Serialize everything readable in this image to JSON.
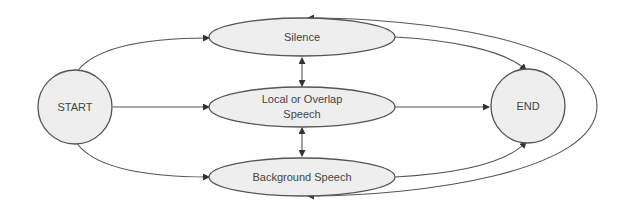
{
  "diagram": {
    "type": "state-transition",
    "colors": {
      "node_fill": "#eeeeee",
      "stroke": "#555555",
      "text": "#444444"
    },
    "nodes": {
      "start": {
        "label": "START",
        "shape": "circle"
      },
      "silence": {
        "label": "Silence",
        "shape": "ellipse"
      },
      "local": {
        "label_line1": "Local or Overlap",
        "label_line2": "Speech",
        "shape": "ellipse"
      },
      "background": {
        "label": "Background Speech",
        "shape": "ellipse"
      },
      "end": {
        "label": "END",
        "shape": "circle"
      }
    },
    "edges": [
      {
        "from": "START",
        "to": "Silence"
      },
      {
        "from": "START",
        "to": "Local or Overlap Speech"
      },
      {
        "from": "START",
        "to": "Background Speech"
      },
      {
        "from": "Silence",
        "to": "END"
      },
      {
        "from": "Local or Overlap Speech",
        "to": "END"
      },
      {
        "from": "Background Speech",
        "to": "END"
      },
      {
        "from": "Silence",
        "to": "Local or Overlap Speech",
        "bidirectional": true
      },
      {
        "from": "Local or Overlap Speech",
        "to": "Background Speech",
        "bidirectional": true
      },
      {
        "from": "Background Speech",
        "to": "Silence",
        "bidirectional": true,
        "note": "outer loop"
      }
    ]
  }
}
